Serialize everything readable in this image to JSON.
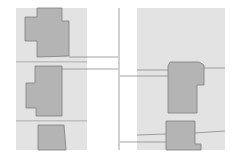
{
  "map": {
    "type": "parcel-building-footprint",
    "colors": {
      "background": "#ffffff",
      "parcel_fill": "#e3e3e3",
      "building_fill": "#b4b4b4",
      "building_stroke": "#7d7d7d",
      "line": "#8a8a8a"
    },
    "parcels": [
      {
        "id": "left-strip-lot-1",
        "x": 16,
        "y": 8,
        "w": 71,
        "h": 54
      },
      {
        "id": "left-strip-lot-2",
        "x": 16,
        "y": 63,
        "w": 71,
        "h": 58
      },
      {
        "id": "left-strip-lot-3",
        "x": 16,
        "y": 122,
        "w": 71,
        "h": 28
      },
      {
        "id": "right-block",
        "x": 137,
        "y": 8,
        "w": 88,
        "h": 142
      }
    ],
    "buildings": [
      {
        "id": "building-left-1",
        "points": "37,8 62,8 62,21 69,21 69,56 37,57 37,41 25,41 25,17 37,17"
      },
      {
        "id": "building-left-2",
        "points": "35,66 62,66 62,116 36,116 36,108 26,108 26,83 35,83"
      },
      {
        "id": "building-left-3",
        "points": "38,125 64,125 66,150 38,150"
      },
      {
        "id": "building-right-1",
        "points": "170,62 199,62 204,65 204,85 197,85 197,113 168,113 168,66"
      },
      {
        "id": "building-right-2",
        "points": "166,121 195,121 195,144 201,144 201,150 166,150"
      }
    ],
    "lines": [
      {
        "id": "road-edge-vertical",
        "x1": 119,
        "y1": 8,
        "x2": 119,
        "y2": 150
      },
      {
        "id": "left-lot-divider-1",
        "x1": 16,
        "y1": 62,
        "x2": 87,
        "y2": 62
      },
      {
        "id": "left-lot-divider-2",
        "x1": 16,
        "y1": 121,
        "x2": 87,
        "y2": 121
      },
      {
        "id": "left-lot-extension-a",
        "x1": 69,
        "y1": 57,
        "x2": 118,
        "y2": 57
      },
      {
        "id": "left-lot-extension-b",
        "x1": 62,
        "y1": 69,
        "x2": 118,
        "y2": 69
      },
      {
        "id": "right-connector-a",
        "x1": 137,
        "y1": 70,
        "x2": 168,
        "y2": 70
      },
      {
        "id": "right-connector-b",
        "x1": 120,
        "y1": 76,
        "x2": 168,
        "y2": 76
      },
      {
        "id": "right-connector-c",
        "x1": 204,
        "y1": 68,
        "x2": 225,
        "y2": 68
      },
      {
        "id": "right-connector-d",
        "x1": 137,
        "y1": 135,
        "x2": 166,
        "y2": 134
      },
      {
        "id": "right-connector-e",
        "x1": 120,
        "y1": 142,
        "x2": 166,
        "y2": 142
      },
      {
        "id": "right-connector-f",
        "x1": 195,
        "y1": 133,
        "x2": 225,
        "y2": 131
      }
    ]
  }
}
